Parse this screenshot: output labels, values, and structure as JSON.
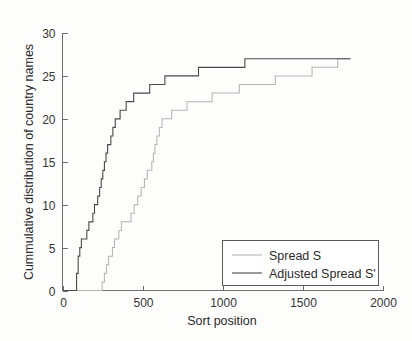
{
  "chart_data": {
    "type": "line",
    "title": "",
    "subtitle": "",
    "xlabel": "Sort position",
    "ylabel": "Cummulative distribution of country names",
    "xlim": [
      0,
      2000
    ],
    "ylim": [
      0,
      30
    ],
    "xticks": [
      0,
      500,
      1000,
      1500,
      2000
    ],
    "yticks": [
      0,
      5,
      10,
      15,
      20,
      25,
      30
    ],
    "xticklabels": [
      "0",
      "500",
      "1000",
      "1500",
      "2000"
    ],
    "yticklabels": [
      "0",
      "5",
      "10",
      "15",
      "20",
      "25",
      "30"
    ],
    "grid": false,
    "legend_position": "lower right",
    "step_style": "post",
    "series": [
      {
        "name": "Spread S",
        "color": "#b4b4b4",
        "x": [
          0,
          235,
          248,
          262,
          275,
          288,
          300,
          312,
          325,
          338,
          352,
          368,
          382,
          398,
          412,
          428,
          448,
          470,
          492,
          512,
          530,
          545,
          558,
          568,
          578,
          590,
          605,
          622,
          640,
          660,
          682,
          708,
          740,
          778,
          820,
          872,
          935,
          1010,
          1105,
          1210,
          1330,
          1450,
          1560,
          1660,
          1720,
          1800
        ],
        "y": [
          0,
          0,
          1,
          2,
          3,
          4,
          4,
          5,
          6,
          6,
          7,
          8,
          8,
          8,
          8,
          9,
          10,
          11,
          12,
          13,
          14,
          14,
          15,
          16,
          17,
          18,
          19,
          20,
          20,
          20,
          21,
          21,
          21,
          22,
          22,
          22,
          23,
          23,
          24,
          24,
          25,
          25,
          26,
          26,
          27,
          27
        ]
      },
      {
        "name": "Adjusted Spread S'",
        "color": "#4a4a4a",
        "x": [
          0,
          78,
          88,
          98,
          108,
          118,
          128,
          140,
          152,
          165,
          178,
          190,
          200,
          210,
          220,
          232,
          242,
          252,
          262,
          272,
          282,
          292,
          302,
          315,
          330,
          345,
          360,
          378,
          398,
          420,
          445,
          472,
          505,
          545,
          590,
          640,
          700,
          770,
          850,
          950,
          1060,
          1140,
          1300,
          1500,
          1680,
          1800
        ],
        "y": [
          0,
          0,
          2,
          4,
          5,
          6,
          6,
          6,
          7,
          8,
          8,
          9,
          10,
          10,
          11,
          12,
          13,
          14,
          15,
          16,
          17,
          17,
          18,
          19,
          20,
          20,
          21,
          21,
          22,
          22,
          23,
          23,
          23,
          24,
          24,
          25,
          25,
          25,
          26,
          26,
          26,
          27,
          27,
          27,
          27,
          27
        ]
      }
    ]
  },
  "legend": {
    "items": [
      {
        "label": "Spread S",
        "color": "#b4b4b4"
      },
      {
        "label": "Adjusted Spread S'",
        "color": "#4a4a4a"
      }
    ]
  },
  "axes": {
    "x_title": "Sort position",
    "y_title": "Cummulative distribution of country names",
    "x_tick_labels": [
      "0",
      "500",
      "1000",
      "1500",
      "2000"
    ],
    "y_tick_labels": [
      "0",
      "5",
      "10",
      "15",
      "20",
      "25",
      "30"
    ]
  },
  "colors": {
    "background": "#fdfdfc",
    "axis": "#6e6e6e",
    "text": "#2b2b2b",
    "series_light": "#b4b4b4",
    "series_dark": "#4a4a4a"
  }
}
